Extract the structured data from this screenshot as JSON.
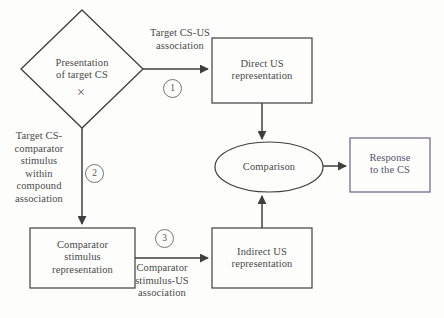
{
  "diagram": {
    "nodes": {
      "presentation": {
        "label": "Presentation\nof target CS",
        "line1": "Presentation",
        "line2": "of target CS",
        "mark": "×",
        "shape": "diamond"
      },
      "direct_us": {
        "line1": "Direct US",
        "line2": "representation",
        "shape": "rectangle"
      },
      "comparison": {
        "label": "Comparison",
        "shape": "ellipse"
      },
      "response": {
        "line1": "Response",
        "line2": "to the CS",
        "shape": "rectangle"
      },
      "comparator_stimulus": {
        "line1": "Comparator",
        "line2": "stimulus",
        "line3": "representation",
        "shape": "rectangle"
      },
      "indirect_us": {
        "line1": "Indirect US",
        "line2": "representation",
        "shape": "rectangle"
      }
    },
    "edge_labels": {
      "target_cs_us": {
        "line1": "Target CS-US",
        "line2": "association"
      },
      "target_cs_comparator": {
        "line1": "Target CS-",
        "line2": "comparator",
        "line3": "stimulus",
        "line4": "within",
        "line5": "compound",
        "line6": "association"
      },
      "comparator_stimulus_us": {
        "line1": "Comparator",
        "line2": "stimulus-US",
        "line3": "association"
      }
    },
    "badges": {
      "one": "1",
      "two": "2",
      "three": "3"
    },
    "colors": {
      "stroke": "#3f3f3f",
      "text": "#4a4a4a",
      "response_border": "#6b6384",
      "response_text": "#55506b",
      "background": "#fdfdfc"
    }
  }
}
